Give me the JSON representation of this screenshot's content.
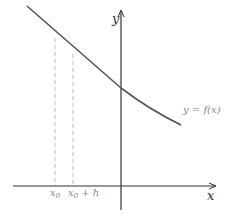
{
  "diagram": {
    "type": "function-graph",
    "axes": {
      "x_label": "x",
      "y_label": "y"
    },
    "curve": {
      "label": "y = f(x)",
      "description": "decreasing convex curve"
    },
    "markers": [
      {
        "label_main": "x",
        "label_sub": "0",
        "label_suffix": ""
      },
      {
        "label_main": "x",
        "label_sub": "0",
        "label_suffix": " + h"
      }
    ],
    "colors": {
      "curve": "#555555",
      "axis": "#333333",
      "dashed": "#bbbbbb",
      "label": "#888888"
    }
  }
}
